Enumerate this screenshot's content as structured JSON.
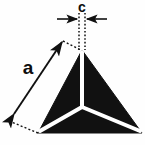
{
  "figure": {
    "shape": "tetrahedron",
    "background_color": "#fefefe",
    "body_color": "#111111",
    "edge_color": "#ffffff",
    "annotation_color": "#0d0d0d",
    "labels": {
      "edge_length": "a",
      "apex_width": "c"
    },
    "geometry": {
      "apex": [
        82,
        50
      ],
      "base_left": [
        38,
        133
      ],
      "base_right": [
        142,
        133
      ],
      "center_node": [
        82,
        107
      ],
      "white_edge_width": 4
    },
    "dimension_a": {
      "label": "a",
      "label_pos": [
        28,
        74
      ],
      "arrow_start": [
        14,
        114
      ],
      "arrow_end": [
        62,
        42
      ],
      "double_headed": true,
      "leader_dotted_top": [
        [
          63,
          41
        ],
        [
          81,
          50
        ]
      ],
      "leader_dotted_bottom": [
        [
          9,
          121
        ],
        [
          38,
          133
        ]
      ]
    },
    "dimension_c": {
      "label": "c",
      "label_pos": [
        80,
        12
      ],
      "arrow_left_from": [
        57,
        19
      ],
      "arrow_left_to": [
        77,
        19
      ],
      "arrow_right_from": [
        106,
        19
      ],
      "arrow_right_to": [
        87,
        19
      ],
      "extension_line_left_x": 79,
      "extension_line_right_x": 85,
      "extension_line_top_y": 13,
      "extension_line_bottom_y": 50,
      "dotted": true
    }
  }
}
